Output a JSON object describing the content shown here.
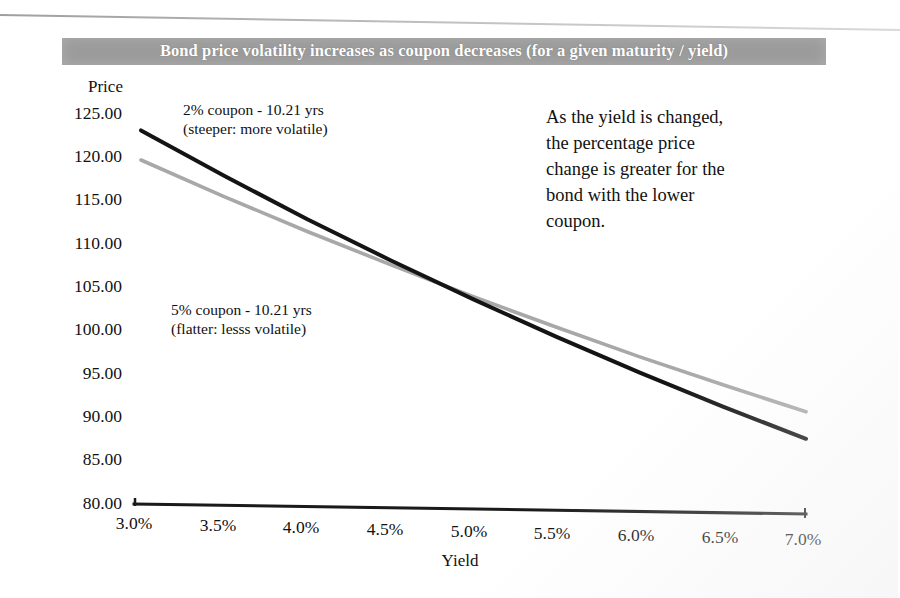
{
  "page": {
    "banner_title": "Bond price volatility increases as coupon decreases (for a given maturity / yield)",
    "banner_color": "#9b9b9b"
  },
  "callout": {
    "line1": "As the yield is changed,",
    "line2": "the  percentage  price",
    "line3": "change is greater for the",
    "line4": "bond   with   the   lower",
    "line5": "coupon.",
    "full_text": "As the yield is changed, the percentage price change is greater for the bond with the lower coupon."
  },
  "annotations": {
    "coupon2": "2% coupon - 10.21 yrs\n(steeper: more volatile)",
    "coupon5": "5% coupon - 10.21 yrs\n(flatter: lesss volatile)"
  },
  "chart_data": {
    "type": "line",
    "title": "Bond price volatility increases as coupon decreases (for a given maturity / yield)",
    "xlabel": "Yield",
    "ylabel": "Price",
    "xlim": [
      3.0,
      7.0
    ],
    "ylim": [
      80.0,
      125.0
    ],
    "grid": false,
    "legend": "inline-annotations",
    "x": [
      3.0,
      3.5,
      4.0,
      4.5,
      5.0,
      5.5,
      6.0,
      6.5,
      7.0
    ],
    "xticklabels": [
      "3.0%",
      "3.5%",
      "4.0%",
      "4.5%",
      "5.0%",
      "5.5%",
      "6.0%",
      "6.5%",
      "7.0%"
    ],
    "yticks": [
      80.0,
      85.0,
      90.0,
      95.0,
      100.0,
      105.0,
      110.0,
      115.0,
      120.0,
      125.0
    ],
    "yticklabels": [
      "80.00",
      "85.00",
      "90.00",
      "95.00",
      "100.00",
      "105.00",
      "110.00",
      "115.00",
      "120.00",
      "125.00"
    ],
    "series": [
      {
        "name": "2% coupon - 10.21 yrs",
        "note": "(steeper: more volatile)",
        "color": "#141414",
        "coupon_pct": 2,
        "maturity_yrs": 10.21,
        "values": [
          123.0,
          117.8,
          112.8,
          108.1,
          103.6,
          99.3,
          95.2,
          91.3,
          87.6
        ]
      },
      {
        "name": "5% coupon - 10.21 yrs",
        "note": "(flatter: lesss volatile)",
        "color": "#a8a8a8",
        "coupon_pct": 5,
        "maturity_yrs": 10.21,
        "values": [
          119.6,
          115.4,
          111.4,
          107.6,
          103.9,
          100.4,
          97.0,
          93.8,
          90.7
        ]
      }
    ]
  }
}
